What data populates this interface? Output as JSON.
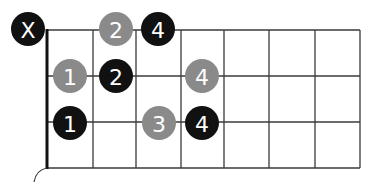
{
  "diagram": {
    "type": "fretboard-chord-chart",
    "colors": {
      "grid": "#3a3a3a",
      "nut": "#111111",
      "black_dot": "#111111",
      "gray_dot": "#8a8a8a",
      "label": "#ffffff"
    },
    "grid": {
      "left": 47,
      "right": 360,
      "top": 30,
      "bottom": 168,
      "fret_lines_x": [
        47,
        93,
        136,
        181,
        224,
        269,
        315,
        360
      ],
      "string_lines_y": [
        30,
        76,
        122,
        168
      ]
    },
    "markers": [
      {
        "id": "mute",
        "label": "X",
        "color": "black",
        "x": 28,
        "y": 29,
        "string": 1,
        "fret": 0
      },
      {
        "id": "s1-f2-gray",
        "label": "2",
        "color": "gray",
        "x": 116,
        "y": 29,
        "string": 1,
        "fret": 2
      },
      {
        "id": "s1-f3-black",
        "label": "4",
        "color": "black",
        "x": 158,
        "y": 29,
        "string": 1,
        "fret": 3
      },
      {
        "id": "s2-f1-gray",
        "label": "1",
        "color": "gray",
        "x": 70,
        "y": 76,
        "string": 2,
        "fret": 1
      },
      {
        "id": "s2-f2-black",
        "label": "2",
        "color": "black",
        "x": 116,
        "y": 76,
        "string": 2,
        "fret": 2
      },
      {
        "id": "s2-f4-gray",
        "label": "4",
        "color": "gray",
        "x": 202,
        "y": 76,
        "string": 2,
        "fret": 4
      },
      {
        "id": "s3-f1-black",
        "label": "1",
        "color": "black",
        "x": 70,
        "y": 123,
        "string": 3,
        "fret": 1
      },
      {
        "id": "s3-f3-gray",
        "label": "3",
        "color": "gray",
        "x": 159,
        "y": 123,
        "string": 3,
        "fret": 3
      },
      {
        "id": "s3-f4-black",
        "label": "4",
        "color": "black",
        "x": 202,
        "y": 123,
        "string": 3,
        "fret": 4
      }
    ]
  }
}
